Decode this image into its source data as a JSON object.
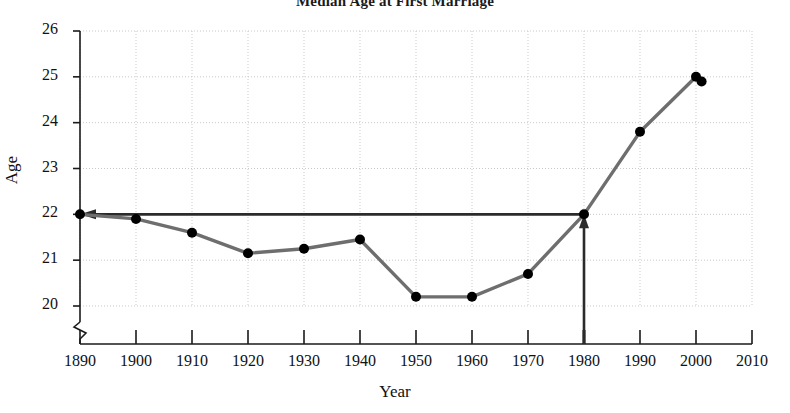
{
  "title": "Median Age at First Marriage",
  "chart_data": {
    "type": "line",
    "title": "Median Age at First Marriage",
    "xlabel": "Year",
    "ylabel": "Age",
    "xlim": [
      1890,
      2010
    ],
    "ylim": [
      20,
      26
    ],
    "xticks": [
      1890,
      1900,
      1910,
      1920,
      1930,
      1940,
      1950,
      1960,
      1970,
      1980,
      1990,
      2000,
      2010
    ],
    "yticks": [
      20,
      21,
      22,
      23,
      24,
      25,
      26
    ],
    "grid": true,
    "y_axis_break": true,
    "legend": "none",
    "x": [
      1890,
      1900,
      1910,
      1920,
      1930,
      1940,
      1950,
      1960,
      1970,
      1980,
      1990,
      2000,
      2001
    ],
    "values": [
      22.0,
      21.9,
      21.6,
      21.15,
      21.25,
      21.45,
      20.2,
      20.2,
      20.7,
      22.0,
      23.8,
      25.0,
      24.9
    ],
    "series": [
      {
        "name": "Median age at first marriage",
        "values": [
          22.0,
          21.9,
          21.6,
          21.15,
          21.25,
          21.45,
          20.2,
          20.2,
          20.7,
          22.0,
          23.8,
          25.0,
          24.9
        ]
      }
    ],
    "annotations": [
      {
        "name": "vertical-guide-arrow",
        "description": "Vertical arrow from x-axis at 1980 pointing up to the curve at age 22",
        "x": 1980,
        "from_y": 20,
        "to_y": 22.0,
        "direction": "up"
      },
      {
        "name": "horizontal-guide-arrow",
        "description": "Horizontal arrow from the 1980 point leftward to the Age axis at 22",
        "y": 22.0,
        "from_x": 1980,
        "to_x": 1890,
        "direction": "left"
      }
    ]
  },
  "y_tick_labels": [
    "26",
    "25",
    "24",
    "23",
    "22",
    "21",
    "20"
  ],
  "x_tick_labels": [
    "1890",
    "1900",
    "1910",
    "1920",
    "1930",
    "1940",
    "1950",
    "1960",
    "1970",
    "1980",
    "1990",
    "2000",
    "2010"
  ],
  "axis": {
    "x_title": "Year",
    "y_title": "Age"
  },
  "colors": {
    "line": "#6e6e6e",
    "marker": "#000000",
    "annotation": "#2b2b2b",
    "axis": "#1a1a1a",
    "grid": "#c9c9c9",
    "background": "#ffffff"
  }
}
